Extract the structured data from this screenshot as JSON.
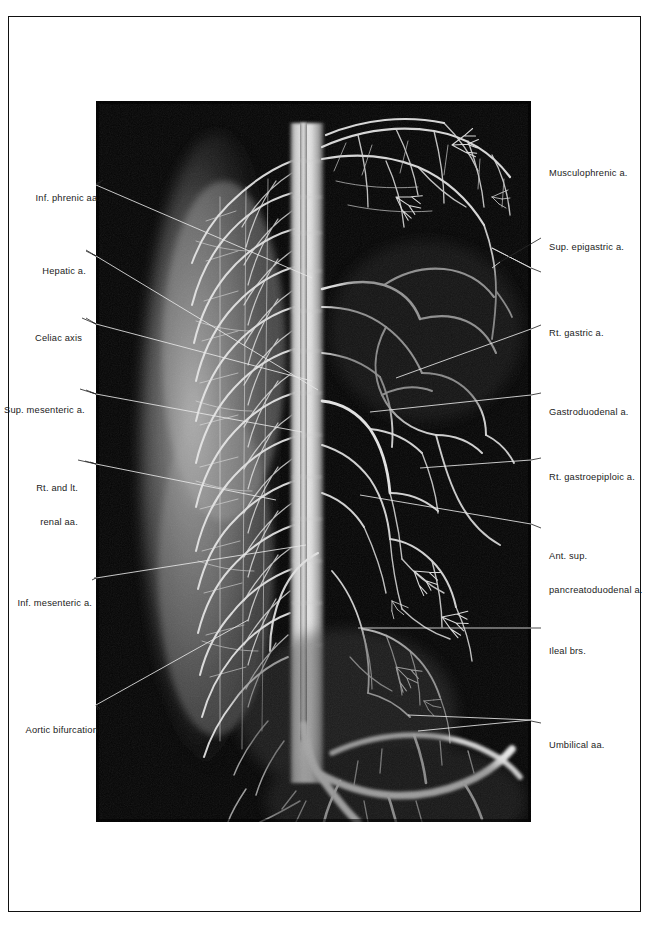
{
  "figure": {
    "running_head": "",
    "plate_alt": "fetal abdominal aortogram radiograph",
    "background_color": "#050505",
    "vessel_color": "#f2f2f2",
    "frame_color": "#111111",
    "leader_color_on_paper": "#262626",
    "leader_color_on_plate": "#e8e8e8"
  },
  "labels_left": [
    {
      "id": "inf-phrenic-aa",
      "text": "Inf. phrenic aa.",
      "lines": [
        "Inf. phrenic aa."
      ]
    },
    {
      "id": "hepatic-a",
      "text": "Hepatic a.",
      "lines": [
        "Hepatic a."
      ]
    },
    {
      "id": "celiac-axis",
      "text": "Celiac axis",
      "lines": [
        "Celiac axis"
      ]
    },
    {
      "id": "sup-mesenteric-a",
      "text": "Sup. mesenteric a.",
      "lines": [
        "Sup. mesenteric a."
      ]
    },
    {
      "id": "rt-and-lt-renal-aa",
      "text": "Rt. and lt. renal aa.",
      "lines": [
        "Rt. and lt.",
        "renal aa."
      ]
    },
    {
      "id": "inf-mesenteric-a",
      "text": "Inf. mesenteric a.",
      "lines": [
        "Inf. mesenteric a."
      ]
    },
    {
      "id": "aortic-bifurcation",
      "text": "Aortic bifurcation",
      "lines": [
        "Aortic bifurcation"
      ]
    }
  ],
  "labels_right": [
    {
      "id": "musculophrenic-a",
      "text": "Musculophrenic a.",
      "lines": [
        "Musculophrenic a."
      ]
    },
    {
      "id": "sup-epigastric-a",
      "text": "Sup. epigastric a.",
      "lines": [
        "Sup. epigastric a."
      ]
    },
    {
      "id": "rt-gastric-a",
      "text": "Rt. gastric a.",
      "lines": [
        "Rt. gastric a."
      ]
    },
    {
      "id": "gastroduodenal-a",
      "text": "Gastroduodenal a.",
      "lines": [
        "Gastroduodenal a."
      ]
    },
    {
      "id": "rt-gastroepiploic-a",
      "text": "Rt. gastroepiploic a.",
      "lines": [
        "Rt. gastroepiploic a."
      ]
    },
    {
      "id": "ant-sup-pancreatoduodenal-a",
      "text": "Ant. sup. pancreatoduodenal a.",
      "lines": [
        "Ant. sup.",
        "pancreatoduodenal a."
      ]
    },
    {
      "id": "ileal-brs",
      "text": "Ileal brs.",
      "lines": [
        "Ileal brs."
      ]
    },
    {
      "id": "umbilical-aa",
      "text": "Umbilical aa.",
      "lines": [
        "Umbilical aa."
      ]
    }
  ]
}
